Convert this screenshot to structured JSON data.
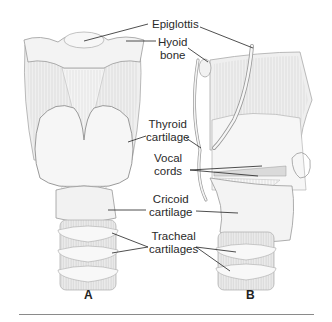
{
  "figure": {
    "panels": [
      {
        "id": "A",
        "label": "A",
        "view": "anterior"
      },
      {
        "id": "B",
        "label": "B",
        "view": "sagittal"
      }
    ],
    "labels": {
      "epiglottis": "Epiglottis",
      "hyoid_line1": "Hyoid",
      "hyoid_line2": "bone",
      "thyroid_line1": "Thyroid",
      "thyroid_line2": "cartilage",
      "vocal_line1": "Vocal",
      "vocal_line2": "cords",
      "cricoid_line1": "Cricoid",
      "cricoid_line2": "cartilage",
      "tracheal_line1": "Tracheal",
      "tracheal_line2": "cartilages"
    },
    "colors": {
      "tissue": "#ececec",
      "tissue_light": "#f6f6f6",
      "outline": "#9a9a9a",
      "striation": "#c4c4c4",
      "leader": "#222222",
      "rule": "#8a8a8a"
    }
  }
}
